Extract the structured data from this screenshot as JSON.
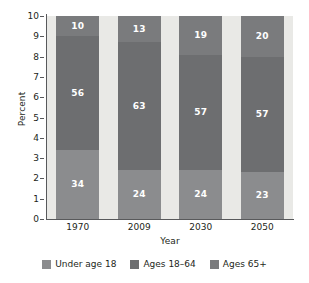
{
  "chart_data": {
    "type": "bar",
    "subtype": "stacked-percent",
    "title": "",
    "xlabel": "Year",
    "ylabel": "Percent",
    "categories": [
      "1970",
      "2009",
      "2030",
      "2050"
    ],
    "series": [
      {
        "name": "Under age 18",
        "color": "#8b8c8e",
        "values": [
          34,
          24,
          24,
          23
        ]
      },
      {
        "name": "Ages 18–64",
        "color": "#6d6e70",
        "values": [
          56,
          63,
          57,
          57
        ]
      },
      {
        "name": "Ages 65+",
        "color": "#7a7b7d",
        "values": [
          10,
          13,
          19,
          20
        ]
      }
    ],
    "ylim": [
      0,
      10
    ],
    "yticks": [
      "0",
      "1",
      "2",
      "3",
      "4",
      "5",
      "6",
      "7",
      "8",
      "9",
      "10"
    ],
    "grid": false,
    "legend_position": "bottom",
    "plot_background": "#e9e9e6",
    "bar_totals": [
      100,
      100,
      100,
      100
    ]
  },
  "axes": {
    "y_title": "Percent",
    "x_title": "Year",
    "y_ticks": [
      "10",
      "9",
      "8",
      "7",
      "6",
      "5",
      "4",
      "3",
      "2",
      "1",
      "0"
    ],
    "x_ticks": [
      "1970",
      "2009",
      "2030",
      "2050"
    ]
  },
  "bars": [
    {
      "category": "1970",
      "segments": [
        {
          "key": "senior",
          "label": "10",
          "pct": 10
        },
        {
          "key": "mid",
          "label": "56",
          "pct": 56
        },
        {
          "key": "under",
          "label": "34",
          "pct": 34
        }
      ]
    },
    {
      "category": "2009",
      "segments": [
        {
          "key": "senior",
          "label": "13",
          "pct": 13
        },
        {
          "key": "mid",
          "label": "63",
          "pct": 63
        },
        {
          "key": "under",
          "label": "24",
          "pct": 24
        }
      ]
    },
    {
      "category": "2030",
      "segments": [
        {
          "key": "senior",
          "label": "19",
          "pct": 19
        },
        {
          "key": "mid",
          "label": "57",
          "pct": 57
        },
        {
          "key": "under",
          "label": "24",
          "pct": 24
        }
      ]
    },
    {
      "category": "2050",
      "segments": [
        {
          "key": "senior",
          "label": "20",
          "pct": 20
        },
        {
          "key": "mid",
          "label": "57",
          "pct": 57
        },
        {
          "key": "under",
          "label": "23",
          "pct": 23
        }
      ]
    }
  ],
  "legend": {
    "items": [
      {
        "label": "Under age 18",
        "key": "under",
        "color": "#8b8c8e"
      },
      {
        "label": "Ages 18–64",
        "key": "mid",
        "color": "#6d6e70"
      },
      {
        "label": "Ages 65+",
        "key": "senior",
        "color": "#7a7b7d"
      }
    ]
  }
}
